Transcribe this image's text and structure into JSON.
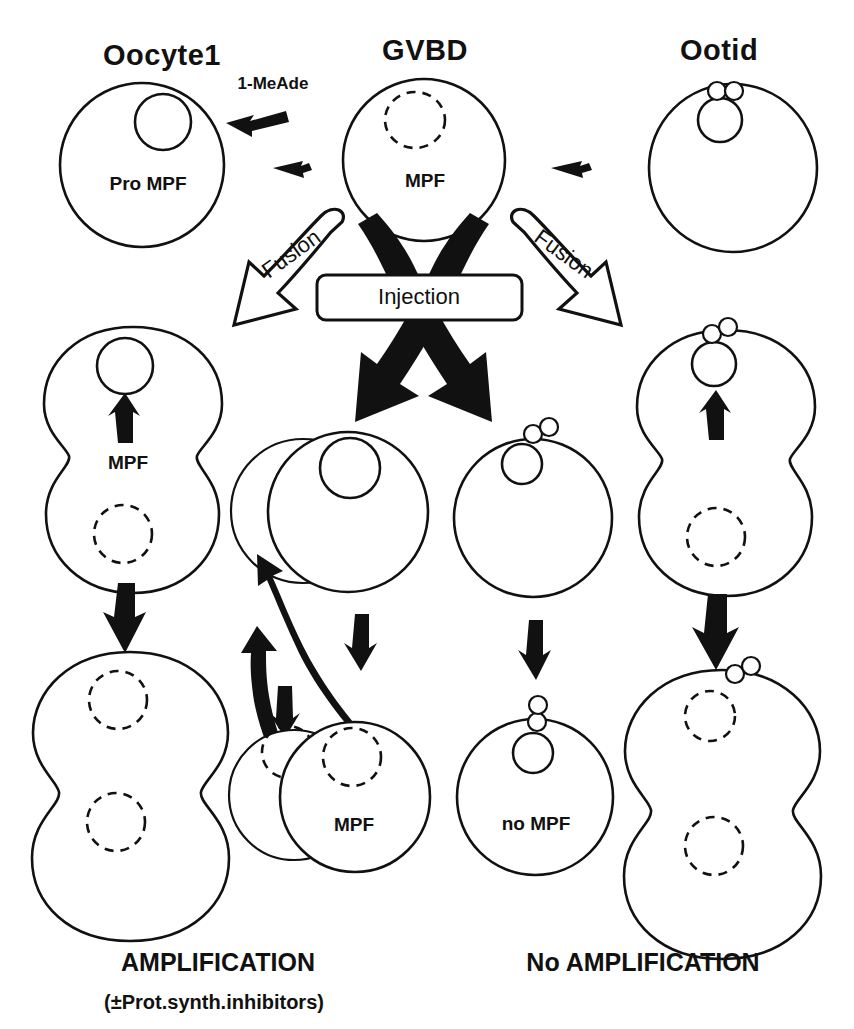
{
  "figure": {
    "kind": "biology-pathway-diagram",
    "background_color": "#ffffff",
    "line_color": "#111111"
  },
  "column_titles": {
    "left": "Oocyte1",
    "center": "GVBD",
    "right": "Ootid"
  },
  "stimulus": {
    "label": "1-MeAde"
  },
  "cell_labels": {
    "oocyte1_contents": "Pro MPF",
    "gvbd_contents": "MPF",
    "left_fusion_contents": "MPF",
    "center_bottom_contents": "MPF",
    "center_right_bottom_contents": "no MPF"
  },
  "process_labels": {
    "fusion_left": "Fusion",
    "fusion_right": "Fusion",
    "injection": "Injection"
  },
  "conclusions": {
    "left_title": "AMPLIFICATION",
    "left_subtitle": "(±Prot.synth.inhibitors)",
    "right_title": "No AMPLIFICATION"
  },
  "icon_names": {
    "stimulus_arrow": "arrow-left-icon",
    "step_arrow": "arrow-right-icon",
    "fusion_arrow": "curved-hollow-arrow-icon",
    "injection_arrow": "crossed-black-arrow-icon",
    "recycle_arrow": "curved-black-arrow-icon",
    "down_arrow": "arrow-down-icon",
    "up_arrow": "arrow-up-icon"
  }
}
